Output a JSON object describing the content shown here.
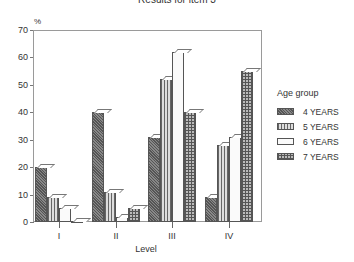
{
  "chart_data": {
    "type": "bar",
    "title": "Results for item 3",
    "xlabel": "Level",
    "ylabel": "%",
    "ylim": [
      0,
      70
    ],
    "yticks": [
      0,
      10,
      20,
      30,
      40,
      50,
      60,
      70
    ],
    "categories": [
      "I",
      "II",
      "III",
      "IV"
    ],
    "legend_title": "Age group",
    "legend_position": "right",
    "grid": false,
    "series": [
      {
        "name": "4 YEARS",
        "pattern": "dense-hatch",
        "values": [
          20,
          40,
          31,
          9
        ]
      },
      {
        "name": "5 YEARS",
        "pattern": "vertical-lines",
        "values": [
          9,
          11,
          52,
          28
        ]
      },
      {
        "name": "6 YEARS",
        "pattern": "white",
        "values": [
          5,
          2,
          62,
          31
        ]
      },
      {
        "name": "7 YEARS",
        "pattern": "grid",
        "values": [
          0,
          5,
          40,
          55
        ]
      }
    ]
  },
  "labels": {
    "title": "Results for item 3",
    "unit": "%",
    "x_axis_title": "Level",
    "legend_title": "Age group"
  }
}
